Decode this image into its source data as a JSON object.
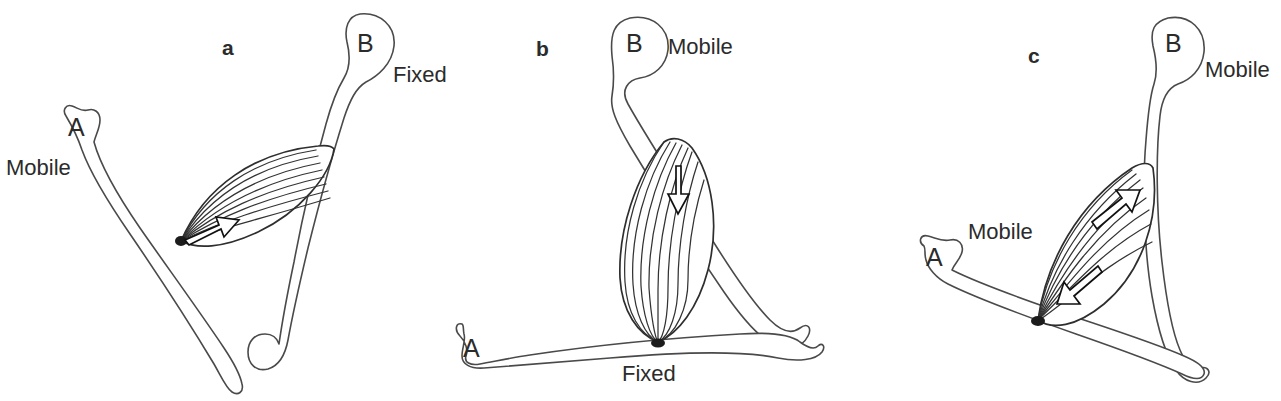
{
  "figure": {
    "background_color": "#ffffff",
    "line_color": "#4a4a4a",
    "ink_color": "#2b2b2b"
  },
  "panels": [
    {
      "id": "a",
      "letter": "a",
      "bone_a_label": "A",
      "bone_b_label": "B",
      "bone_a_state": "Mobile",
      "bone_b_state": "Fixed",
      "arrow_count": 1,
      "arrow_directions": [
        "up-right"
      ],
      "description": "Bone A mobile, bone B fixed; single arrow at muscle insertion on bone A"
    },
    {
      "id": "b",
      "letter": "b",
      "bone_a_label": "A",
      "bone_b_label": "B",
      "bone_a_state": "Fixed",
      "bone_b_state": "Mobile",
      "arrow_count": 1,
      "arrow_directions": [
        "down"
      ],
      "description": "Bone A fixed horizontally, bone B mobile; single downward arrow on muscle"
    },
    {
      "id": "c",
      "letter": "c",
      "bone_a_label": "A",
      "bone_b_label": "B",
      "bone_a_state": "Mobile",
      "bone_b_state": "Mobile",
      "arrow_count": 2,
      "arrow_directions": [
        "up-right",
        "down-left"
      ],
      "description": "Both bones mobile; two opposing arrows within the muscle belly"
    }
  ],
  "muscle": {
    "fiber_count": 8,
    "belly_fill": "#ffffff",
    "belly_stroke": "#2e2e2e"
  }
}
